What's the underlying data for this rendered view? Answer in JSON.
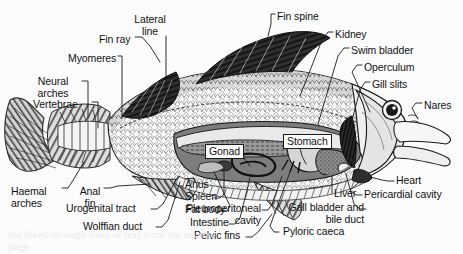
{
  "figure": {
    "style": "black-and-white halftone scan",
    "background_color": "#fcfcfc",
    "ink_color": "#1a1a1a"
  },
  "labels": [
    {
      "id": "lateral-line",
      "text": "Lateral\nline",
      "x": 150,
      "y": 14,
      "align": "center"
    },
    {
      "id": "fin-spine",
      "text": "Fin spine",
      "x": 277,
      "y": 11,
      "align": "left"
    },
    {
      "id": "fin-ray",
      "text": "Fin ray",
      "x": 99,
      "y": 34,
      "align": "left"
    },
    {
      "id": "kidney",
      "text": "Kidney",
      "x": 335,
      "y": 29,
      "align": "left"
    },
    {
      "id": "myomeres",
      "text": "Myomeres",
      "x": 68,
      "y": 53,
      "align": "left"
    },
    {
      "id": "swim-bladder",
      "text": "Swim bladder",
      "x": 351,
      "y": 45,
      "align": "left"
    },
    {
      "id": "operculum",
      "text": "Operculum",
      "x": 364,
      "y": 62,
      "align": "left"
    },
    {
      "id": "neural-arches",
      "text": "Neural\narches",
      "x": 53,
      "y": 76,
      "align": "center"
    },
    {
      "id": "gill-slits",
      "text": "Gill slits",
      "x": 372,
      "y": 79,
      "align": "left"
    },
    {
      "id": "vertebrae",
      "text": "Vertebrae",
      "x": 46,
      "y": 99,
      "align": "left"
    },
    {
      "id": "nares",
      "text": "Nares",
      "x": 424,
      "y": 100,
      "align": "left"
    },
    {
      "id": "gonad",
      "text": "Gonad",
      "x": 209,
      "y": 146,
      "align": "left",
      "boxed": true
    },
    {
      "id": "stomach",
      "text": "Stomach",
      "x": 285,
      "y": 136,
      "align": "left",
      "boxed": true
    },
    {
      "id": "haemal-arches",
      "text": "Haemal\narches",
      "x": 13,
      "y": 186,
      "align": "left"
    },
    {
      "id": "anal-fin",
      "text": "Anal\nfin",
      "x": 83,
      "y": 186,
      "align": "left"
    },
    {
      "id": "anus",
      "text": "Anus",
      "x": 185,
      "y": 184,
      "align": "left"
    },
    {
      "id": "heart",
      "text": "Heart",
      "x": 396,
      "y": 178,
      "align": "left"
    },
    {
      "id": "spleen",
      "text": "Spleen",
      "x": 185,
      "y": 196,
      "align": "left"
    },
    {
      "id": "liver",
      "text": "Liver",
      "x": 322,
      "y": 195,
      "align": "left"
    },
    {
      "id": "pericardial-cavity",
      "text": "Pericardial cavity",
      "x": 364,
      "y": 192,
      "align": "left"
    },
    {
      "id": "urogenital-tract",
      "text": "Urogenital tract",
      "x": 83,
      "y": 206,
      "align": "left"
    },
    {
      "id": "fat-body",
      "text": "Fat body",
      "x": 185,
      "y": 208,
      "align": "left"
    },
    {
      "id": "pleuroperitoneal-cavity",
      "text": "Pleuroperitoneal\ncavity",
      "x": 259,
      "y": 207,
      "align": "right"
    },
    {
      "id": "gall-bladder-bile-duct",
      "text": "Gall bladder and\nbile duct",
      "x": 364,
      "y": 206,
      "align": "right"
    },
    {
      "id": "wolffian-duct",
      "text": "Wolffian duct",
      "x": 83,
      "y": 224,
      "align": "left"
    },
    {
      "id": "intestine",
      "text": "Intestine",
      "x": 190,
      "y": 221,
      "align": "left"
    },
    {
      "id": "pyloric-caeca",
      "text": "Pyloric caeca",
      "x": 281,
      "y": 229,
      "align": "left"
    },
    {
      "id": "pelvic-fins",
      "text": "Pelvic fins",
      "x": 194,
      "y": 234,
      "align": "left"
    }
  ],
  "bleed_through_text": "the bleed-through lines of text from the reverse page"
}
